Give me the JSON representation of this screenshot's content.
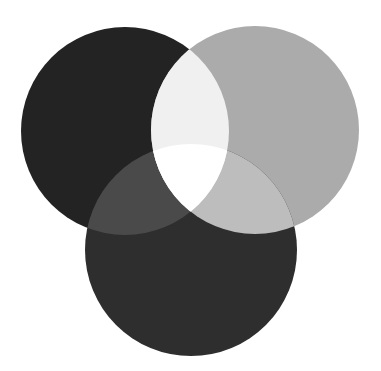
{
  "canvas": {
    "width": 381,
    "height": 371,
    "background": "#ffffff"
  },
  "diagram": {
    "type": "venn-3-circle",
    "circles": [
      {
        "id": "top-left",
        "cx": 125,
        "cy": 131,
        "r": 104,
        "color": "#232323"
      },
      {
        "id": "top-right",
        "cx": 255,
        "cy": 130,
        "r": 104,
        "color": "#ababab"
      },
      {
        "id": "bottom",
        "cx": 191,
        "cy": 250,
        "r": 106,
        "color": "#2e2e2e"
      }
    ],
    "overlaps": {
      "top-left_bottom": "#4a4a4a",
      "top-right_bottom": "#bdbdbd",
      "top-left_top-right": "#f0f0f0",
      "all_three": "#ffffff"
    }
  }
}
